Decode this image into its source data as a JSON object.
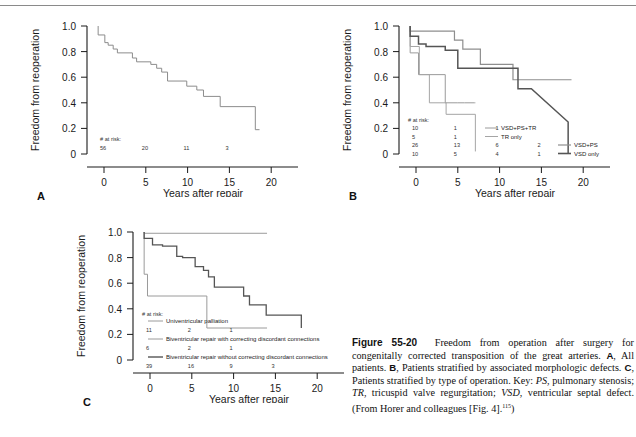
{
  "figure": {
    "number": "Figure 55-20",
    "caption_text": "Freedom from operation after surgery for congenitally corrected transposition of the great arteries. ",
    "part_a_marker": "A",
    "part_a_text": ", All patients. ",
    "part_b_marker": "B",
    "part_b_text": ", Patients stratified by associated morphologic defects. ",
    "part_c_marker": "C",
    "part_c_text": ", Patients stratified by type of operation. Key: ",
    "key_ps": "PS",
    "key_ps_def": ", pulmonary stenosis; ",
    "key_tr": "TR",
    "key_tr_def": ", tricuspid valve regurgitation; ",
    "key_vsd": "VSD",
    "key_vsd_def": ", ventricular septal defect. (From Horer and colleagues [Fig. 4].",
    "reference": "115",
    "caption_end": ")"
  },
  "axes": {
    "ylabel": "Freedom from reoperation",
    "xlabel": "Years after repair",
    "yticks": [
      "1.0",
      "0.8",
      "0.6",
      "0.4",
      "0.2",
      "0"
    ],
    "xticks": [
      "0",
      "5",
      "10",
      "15",
      "20"
    ],
    "risk_header": "# at risk:"
  },
  "panels": {
    "a": {
      "letter": "A",
      "risk_values": [
        "56",
        "20",
        "11",
        "3"
      ],
      "risk_x": [
        0,
        5,
        10,
        15
      ]
    },
    "b": {
      "letter": "B",
      "risk_rows": [
        {
          "series": "VSD+PS+TR",
          "values": [
            "10",
            "1",
            "1"
          ],
          "x": [
            0,
            5,
            10
          ]
        },
        {
          "series": "TR only",
          "values": [
            "5",
            "1"
          ],
          "x": [
            0,
            5
          ]
        },
        {
          "series": "VSD+PS",
          "values": [
            "26",
            "13",
            "6",
            "2"
          ],
          "x": [
            0,
            5,
            10,
            15
          ]
        },
        {
          "series": "VSD only",
          "values": [
            "10",
            "5",
            "4",
            "1"
          ],
          "x": [
            0,
            5,
            10,
            15
          ]
        }
      ],
      "legend": [
        "VSD+PS+TR",
        "TR only",
        "VSD+PS",
        "VSD only"
      ]
    },
    "c": {
      "letter": "C",
      "legend": [
        "Univentricular palliation",
        "Biventricular repair with correcting discordant connections",
        "Biventricular repair without correcting discordant connections"
      ],
      "risk_rows": [
        {
          "series": "Univentricular palliation",
          "values": [
            "11",
            "2",
            "1"
          ],
          "x": [
            0,
            5,
            10
          ]
        },
        {
          "series": "Biventricular repair with correcting discordant connections",
          "values": [
            "6",
            "2",
            "1"
          ],
          "x": [
            0,
            5,
            10
          ]
        },
        {
          "series": "Biventricular repair without correcting discordant connections",
          "values": [
            "39",
            "16",
            "9",
            "3"
          ],
          "x": [
            0,
            5,
            10,
            15
          ]
        }
      ]
    }
  },
  "chart_data": [
    {
      "type": "line",
      "panel": "A",
      "title": "All patients",
      "xlabel": "Years after repair",
      "ylabel": "Freedom from reoperation",
      "xlim": [
        -1,
        23
      ],
      "ylim": [
        0,
        1.05
      ],
      "series": [
        {
          "name": "All patients",
          "step": true,
          "color": "#8c8c8c",
          "x": [
            -0.7,
            -0.7,
            0.1,
            0.1,
            0.5,
            0.5,
            1.1,
            1.1,
            1.6,
            1.6,
            3.4,
            3.4,
            3.9,
            3.9,
            5.6,
            5.6,
            6.3,
            6.3,
            6.9,
            6.9,
            7.6,
            7.6,
            9.9,
            9.9,
            11.1,
            11.1,
            11.9,
            11.9,
            13.9,
            13.9,
            18.1,
            18.1,
            18.6
          ],
          "y": [
            1.0,
            0.93,
            0.93,
            0.87,
            0.87,
            0.85,
            0.85,
            0.82,
            0.82,
            0.79,
            0.79,
            0.75,
            0.75,
            0.72,
            0.72,
            0.7,
            0.7,
            0.67,
            0.67,
            0.64,
            0.64,
            0.57,
            0.57,
            0.53,
            0.53,
            0.5,
            0.5,
            0.45,
            0.45,
            0.37,
            0.37,
            0.19,
            0.19
          ]
        }
      ]
    },
    {
      "type": "line",
      "panel": "B",
      "title": "Patients stratified by associated morphologic defects",
      "xlabel": "Years after repair",
      "ylabel": "Freedom from reoperation",
      "xlim": [
        -1,
        23
      ],
      "ylim": [
        0,
        1.05
      ],
      "series": [
        {
          "name": "VSD+PS+TR",
          "step": true,
          "color": "#9a9a9a",
          "width": 1.0,
          "x": [
            -0.7,
            -0.7,
            0.3,
            0.3,
            3.5,
            3.5,
            5.0,
            5.0,
            5.8,
            5.8,
            7.0,
            7.0,
            7.1
          ],
          "y": [
            1.0,
            0.79,
            0.79,
            0.62,
            0.62,
            0.4,
            0.4,
            0.4,
            0.4,
            0.4,
            0.4,
            0.4,
            0.4
          ]
        },
        {
          "name": "TR only",
          "step": true,
          "color": "#a5a5a5",
          "width": 1.0,
          "x": [
            -0.7,
            -0.7,
            0.4,
            0.4,
            1.6,
            1.6,
            3.6,
            3.6,
            7.1,
            7.1
          ],
          "y": [
            1.0,
            0.84,
            0.84,
            0.62,
            0.62,
            0.4,
            0.4,
            0.31,
            0.31,
            0.02
          ]
        },
        {
          "name": "VSD+PS",
          "step": true,
          "color": "#8e8e8e",
          "width": 1.2,
          "x": [
            -0.7,
            -0.7,
            0.4,
            0.4,
            4.6,
            4.6,
            5.6,
            5.6,
            7.7,
            7.7,
            11.6,
            11.6,
            18.6
          ],
          "y": [
            1.0,
            0.96,
            0.96,
            0.96,
            0.96,
            0.89,
            0.89,
            0.82,
            0.82,
            0.7,
            0.7,
            0.58,
            0.58
          ]
        },
        {
          "name": "VSD only",
          "step": true,
          "color": "#555555",
          "width": 1.5,
          "x": [
            -0.7,
            -0.7,
            0.3,
            0.3,
            1.2,
            1.2,
            3.5,
            3.5,
            5.0,
            5.0,
            10.9,
            10.9,
            12.2,
            12.2,
            13.8,
            13.8,
            18.2,
            18.2
          ],
          "y": [
            1.0,
            0.92,
            0.92,
            0.86,
            0.86,
            0.84,
            0.84,
            0.81,
            0.81,
            0.67,
            0.67,
            0.67,
            0.67,
            0.51,
            0.51,
            0.51,
            0.25,
            0.0
          ]
        }
      ]
    },
    {
      "type": "line",
      "panel": "C",
      "title": "Patients stratified by type of operation",
      "xlabel": "Years after repair",
      "ylabel": "Freedom from reoperation",
      "xlim": [
        -1,
        23
      ],
      "ylim": [
        0,
        1.05
      ],
      "series": [
        {
          "name": "Univentricular palliation",
          "step": true,
          "color": "#9a9a9a",
          "width": 1.0,
          "x": [
            -0.7,
            -0.7,
            14.0
          ],
          "y": [
            1.0,
            0.99,
            0.99
          ]
        },
        {
          "name": "Biventricular repair with correcting discordant connections",
          "step": true,
          "color": "#9a9a9a",
          "width": 1.0,
          "x": [
            -0.7,
            -0.7,
            -0.3,
            -0.3,
            6.8,
            6.8,
            14.0
          ],
          "y": [
            1.0,
            0.67,
            0.67,
            0.5,
            0.5,
            0.25,
            0.25
          ]
        },
        {
          "name": "Biventricular repair without correcting discordant connections",
          "step": true,
          "color": "#555555",
          "width": 1.3,
          "x": [
            -0.7,
            -0.7,
            0.3,
            0.3,
            1.5,
            1.5,
            3.2,
            3.2,
            3.9,
            3.9,
            5.4,
            5.4,
            6.4,
            6.4,
            7.0,
            7.0,
            7.7,
            7.7,
            9.9,
            9.9,
            11.2,
            11.2,
            11.9,
            11.9,
            13.9,
            13.9,
            18.1,
            18.1
          ],
          "y": [
            1.0,
            0.95,
            0.95,
            0.9,
            0.9,
            0.89,
            0.89,
            0.81,
            0.81,
            0.8,
            0.8,
            0.73,
            0.73,
            0.7,
            0.7,
            0.65,
            0.65,
            0.57,
            0.57,
            0.57,
            0.57,
            0.5,
            0.5,
            0.43,
            0.43,
            0.35,
            0.35,
            0.25
          ]
        }
      ]
    }
  ]
}
